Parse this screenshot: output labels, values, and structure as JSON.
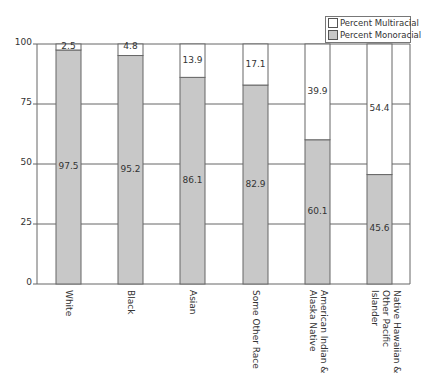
{
  "chart_data": {
    "type": "bar",
    "stacked": true,
    "title": "",
    "xlabel": "",
    "ylabel": "",
    "ylim": [
      0,
      100
    ],
    "yticks": [
      0,
      25,
      50,
      75,
      100
    ],
    "grid": "horizontal",
    "legend_position": "top-right",
    "categories": [
      "White",
      "Black",
      "Asian",
      "Some Other Race",
      "American Indian & Alaska Native",
      "Native Hawaiian & Other Pacific Islander"
    ],
    "category_label_lines": [
      [
        "White"
      ],
      [
        "Black"
      ],
      [
        "Asian"
      ],
      [
        "Some Other Race"
      ],
      [
        "American Indian &",
        "Alaska Native"
      ],
      [
        "Native Hawaiian &",
        "Other Pacific Islander"
      ]
    ],
    "series": [
      {
        "name": "Percent Monoracial",
        "color": "#c8c8c8",
        "values": [
          97.5,
          95.2,
          86.1,
          82.9,
          60.1,
          45.6
        ]
      },
      {
        "name": "Percent Multiracial",
        "color": "#ffffff",
        "values": [
          2.5,
          4.8,
          13.9,
          17.1,
          39.9,
          54.4
        ]
      }
    ]
  },
  "legend": {
    "items": [
      {
        "label": "Percent Multiracial",
        "color": "#ffffff"
      },
      {
        "label": "Percent Monoracial",
        "color": "#c8c8c8"
      }
    ]
  }
}
